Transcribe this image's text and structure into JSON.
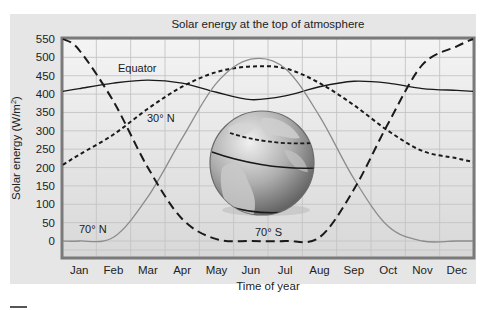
{
  "chart_data": {
    "type": "line",
    "title": "Solar energy at the top of atmosphere",
    "xlabel": "Time of year",
    "ylabel": "Solar energy (W/m²)",
    "ylim": [
      0,
      550
    ],
    "yticks": [
      0,
      50,
      100,
      150,
      200,
      250,
      300,
      350,
      400,
      450,
      500,
      550
    ],
    "categories": [
      "Jan",
      "Feb",
      "Mar",
      "Apr",
      "May",
      "Jun",
      "Jul",
      "Aug",
      "Sep",
      "Oct",
      "Nov",
      "Dec"
    ],
    "grid": true,
    "legend_position": "inline labels",
    "series": [
      {
        "name": "Equator",
        "style": "solid-dark",
        "values": [
          415,
          430,
          438,
          430,
          405,
          385,
          395,
          420,
          435,
          430,
          415,
          410
        ]
      },
      {
        "name": "30° N",
        "style": "short-dash",
        "values": [
          235,
          290,
          360,
          420,
          460,
          475,
          470,
          430,
          370,
          300,
          245,
          225
        ]
      },
      {
        "name": "70° N",
        "style": "solid-light",
        "values": [
          0,
          10,
          120,
          280,
          430,
          495,
          470,
          340,
          170,
          40,
          0,
          0
        ]
      },
      {
        "name": "70° S",
        "style": "long-dash",
        "values": [
          520,
          380,
          200,
          60,
          5,
          0,
          0,
          10,
          140,
          320,
          480,
          530
        ]
      }
    ],
    "annotations": [
      "Equator",
      "30° N",
      "70° N",
      "70° S",
      "globe illustration with 30° N and 70° latitude bands"
    ]
  },
  "labels": {
    "title": "Solar energy at the top of atmosphere",
    "xlabel": "Time of year",
    "ylabel": "Solar energy (W/m",
    "ylabel_sup": "2",
    "ylabel_end": ")",
    "equator": "Equator",
    "lat30n": "30° N",
    "lat70n": "70° N",
    "lat70s": "70° S"
  },
  "colors": {
    "panel_bg": "#e6e6e6",
    "plot_bg": "#efefef",
    "frame": "#7a7a7a",
    "grid": "#c6c6c6",
    "dark_line": "#1a1a1a",
    "light_line": "#8c8c8c"
  }
}
